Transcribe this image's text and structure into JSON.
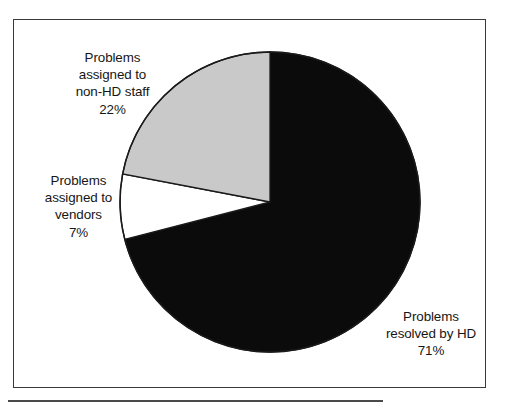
{
  "page": {
    "background_color": "#ffffff",
    "frame_color": "#3a3a3a",
    "rule_color": "#4a4a4a"
  },
  "chart_data": {
    "type": "pie",
    "title": "",
    "subtitle": "",
    "xlabel": "",
    "ylabel": "",
    "legend_position": "none",
    "grid": false,
    "start_angle_deg": 0,
    "direction": "clockwise",
    "categories": [
      "Problems resolved by HD",
      "Problems assigned to non-HD staff",
      "Problems assigned to vendors"
    ],
    "values": [
      71,
      22,
      7
    ],
    "value_unit": "%",
    "colors": [
      "#0b0b0b",
      "#c9c9c9",
      "#ffffff"
    ],
    "slices": [
      {
        "name": "Problems resolved by HD",
        "value": 71,
        "label_text": "71%",
        "color": "#0b0b0b",
        "edge_color": "#1a1a1a"
      },
      {
        "name": "Problems assigned to non-HD staff",
        "value": 22,
        "label_text": "22%",
        "color": "#c9c9c9",
        "edge_color": "#1a1a1a"
      },
      {
        "name": "Problems assigned to vendors",
        "value": 7,
        "label_text": "7%",
        "color": "#ffffff",
        "edge_color": "#1a1a1a"
      }
    ],
    "annotations": [
      {
        "id": "non-hd-staff",
        "lines": [
          "Problems",
          "assigned to",
          "non-HD staff",
          "22%"
        ]
      },
      {
        "id": "vendors",
        "lines": [
          "Problems",
          "assigned to",
          "vendors",
          "7%"
        ]
      },
      {
        "id": "resolved-by-hd",
        "lines": [
          "Problems",
          "resolved by HD",
          "71%"
        ]
      }
    ]
  },
  "labels": {
    "non_hd_staff": {
      "line1": "Problems",
      "line2": "assigned to",
      "line3": "non-HD staff",
      "line4": "22%"
    },
    "vendors": {
      "line1": "Problems",
      "line2": "assigned to",
      "line3": "vendors",
      "line4": "7%"
    },
    "resolved_by_hd": {
      "line1": "Problems",
      "line2": "resolved by HD",
      "line3": "71%"
    }
  }
}
